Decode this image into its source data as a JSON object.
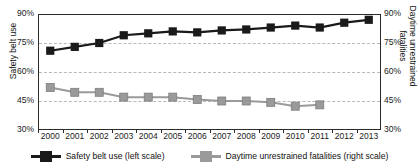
{
  "chart_data": {
    "type": "line",
    "title": "",
    "xlabel": "",
    "categories": [
      "2000",
      "2001",
      "2002",
      "2003",
      "2004",
      "2005",
      "2006",
      "2007",
      "2008",
      "2009",
      "2010",
      "2011",
      "2012",
      "2013"
    ],
    "grid": true,
    "legend_position": "bottom",
    "axes": {
      "left": {
        "label": "Safety belt use",
        "ticks": [
          "90%",
          "75%",
          "60%",
          "45%",
          "30%"
        ],
        "tick_values": [
          90,
          75,
          60,
          45,
          30
        ],
        "min": 30,
        "max": 90
      },
      "right": {
        "label_line1": "Daytime unrestrained",
        "label_line2": "fatalities",
        "label": "Daytime unrestrained fatalities",
        "ticks": [
          "90%",
          "75%",
          "60%",
          "45%",
          "30%"
        ],
        "tick_values": [
          90,
          75,
          60,
          45,
          30
        ],
        "min": 30,
        "max": 90
      }
    },
    "series": [
      {
        "name": "Safety belt use (left scale)",
        "axis": "left",
        "color": "#1a1a1a",
        "marker": "square",
        "x": [
          "2000",
          "2001",
          "2002",
          "2003",
          "2004",
          "2005",
          "2006",
          "2007",
          "2008",
          "2009",
          "2010",
          "2011",
          "2012",
          "2013"
        ],
        "values": [
          71,
          73,
          75,
          79,
          80,
          81,
          80.5,
          81.5,
          82,
          83,
          84,
          83,
          85.5,
          87
        ]
      },
      {
        "name": "Daytime unrestrained fatalities (right scale)",
        "axis": "right",
        "color": "#9a9a9a",
        "marker": "square",
        "x": [
          "2000",
          "2001",
          "2002",
          "2003",
          "2004",
          "2005",
          "2006",
          "2007",
          "2008",
          "2009",
          "2010",
          "2011"
        ],
        "values": [
          52,
          49.5,
          49.5,
          47,
          47,
          47,
          45.8,
          45,
          45,
          44.3,
          42.3,
          43
        ]
      }
    ]
  },
  "legend": {
    "items": [
      {
        "label": "Safety belt use (left scale)",
        "color": "#1a1a1a"
      },
      {
        "label": "Daytime unrestrained fatalities (right scale)",
        "color": "#9a9a9a"
      }
    ]
  }
}
